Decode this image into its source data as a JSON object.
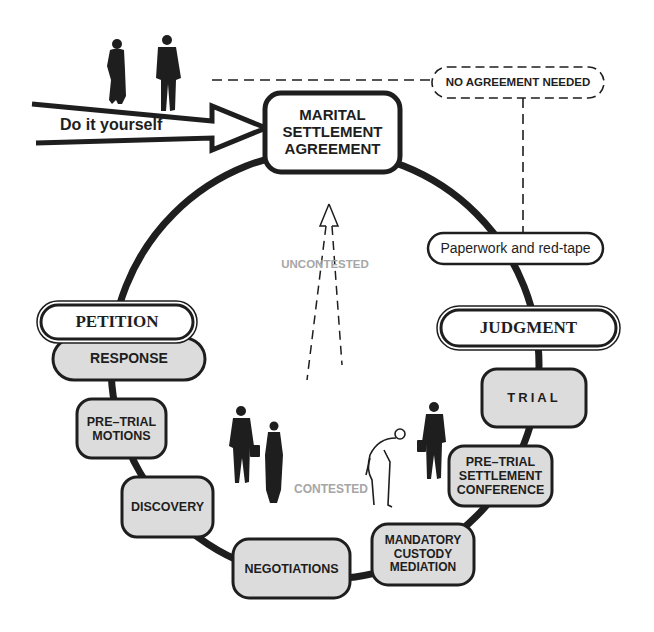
{
  "diagram": {
    "colors": {
      "ink": "#1e1e1e",
      "box_fill": "#dcdcdc",
      "pill_fill": "#ffffff",
      "label_gray": "#a6a6a6",
      "background": "#ffffff"
    },
    "entry_arrow": {
      "label": "Do it yourself"
    },
    "center_node": {
      "lines": [
        "MARITAL",
        "SETTLEMENT",
        "AGREEMENT"
      ]
    },
    "bypass": {
      "label": "NO AGREEMENT NEEDED",
      "style": "dashed"
    },
    "paperwork": {
      "label": "Paperwork and red-tape"
    },
    "milestones": {
      "petition": "PETITION",
      "judgment": "JUDGMENT"
    },
    "steps": [
      {
        "id": "response",
        "lines": [
          "RESPONSE"
        ]
      },
      {
        "id": "pre-trial-motions",
        "lines": [
          "PRE–TRIAL",
          "MOTIONS"
        ]
      },
      {
        "id": "discovery",
        "lines": [
          "DISCOVERY"
        ]
      },
      {
        "id": "negotiations",
        "lines": [
          "NEGOTIATIONS"
        ]
      },
      {
        "id": "mandatory-custody-mediation",
        "lines": [
          "MANDATORY",
          "CUSTODY",
          "MEDIATION"
        ]
      },
      {
        "id": "pre-trial-settlement-conference",
        "lines": [
          "PRE–TRIAL",
          "SETTLEMENT",
          "CONFERENCE"
        ]
      },
      {
        "id": "trial",
        "lines": [
          "TRIAL"
        ]
      }
    ],
    "paths": {
      "uncontested": "UNCONTESTED",
      "contested": "CONTESTED"
    },
    "figures": [
      "woman-silhouette-top",
      "man-silhouette-top",
      "man-with-briefcase-left",
      "woman-in-dress-center",
      "bent-over-man-sketch",
      "man-with-briefcase-right"
    ]
  }
}
